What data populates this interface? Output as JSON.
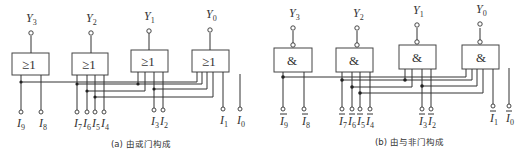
{
  "figure": {
    "panels": [
      {
        "id": "a",
        "caption": "(a) 由或门构成",
        "gate_symbol": "≥1",
        "gate_type": "OR",
        "inverted_inputs": false,
        "outputs": [
          {
            "name": "Y",
            "sub": "3"
          },
          {
            "name": "Y",
            "sub": "2"
          },
          {
            "name": "Y",
            "sub": "1"
          },
          {
            "name": "Y",
            "sub": "0"
          }
        ],
        "inputs": [
          {
            "name": "I",
            "sub": "9"
          },
          {
            "name": "I",
            "sub": "8"
          },
          {
            "name": "I",
            "sub": "7"
          },
          {
            "name": "I",
            "sub": "6"
          },
          {
            "name": "I",
            "sub": "5"
          },
          {
            "name": "I",
            "sub": "4"
          },
          {
            "name": "I",
            "sub": "3"
          },
          {
            "name": "I",
            "sub": "2"
          },
          {
            "name": "I",
            "sub": "1"
          },
          {
            "name": "I",
            "sub": "0"
          }
        ]
      },
      {
        "id": "b",
        "caption": "(b) 由与非门构成",
        "gate_symbol": "&",
        "gate_type": "NAND",
        "inverted_inputs": true,
        "outputs": [
          {
            "name": "Y",
            "sub": "3"
          },
          {
            "name": "Y",
            "sub": "2"
          },
          {
            "name": "Y",
            "sub": "1"
          },
          {
            "name": "Y",
            "sub": "0"
          }
        ],
        "inputs": [
          {
            "name": "I",
            "sub": "9"
          },
          {
            "name": "I",
            "sub": "8"
          },
          {
            "name": "I",
            "sub": "7"
          },
          {
            "name": "I",
            "sub": "6"
          },
          {
            "name": "I",
            "sub": "5"
          },
          {
            "name": "I",
            "sub": "4"
          },
          {
            "name": "I",
            "sub": "3"
          },
          {
            "name": "I",
            "sub": "2"
          },
          {
            "name": "I",
            "sub": "1"
          },
          {
            "name": "I",
            "sub": "0"
          }
        ]
      }
    ]
  }
}
